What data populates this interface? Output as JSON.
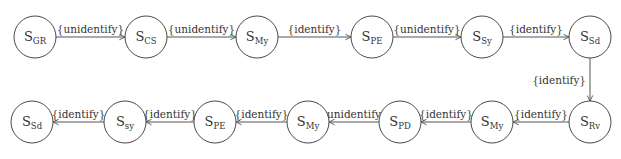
{
  "diagram": {
    "type": "state-transition",
    "nodes": [
      {
        "id": "n1",
        "main": "S",
        "sub": "GR",
        "x": 35,
        "y": 37
      },
      {
        "id": "n2",
        "main": "S",
        "sub": "CS",
        "x": 146,
        "y": 37
      },
      {
        "id": "n3",
        "main": "S",
        "sub": "My",
        "x": 257,
        "y": 37
      },
      {
        "id": "n4",
        "main": "S",
        "sub": "PE",
        "x": 372,
        "y": 37
      },
      {
        "id": "n5",
        "main": "S",
        "sub": "Sy",
        "x": 482,
        "y": 37
      },
      {
        "id": "n6",
        "main": "S",
        "sub": "Sd",
        "x": 590,
        "y": 37
      },
      {
        "id": "n7",
        "main": "S",
        "sub": "Rv",
        "x": 590,
        "y": 122
      },
      {
        "id": "n8",
        "main": "S",
        "sub": "My",
        "x": 492,
        "y": 122
      },
      {
        "id": "n9",
        "main": "S",
        "sub": "PD",
        "x": 400,
        "y": 122
      },
      {
        "id": "n10",
        "main": "S",
        "sub": "My",
        "x": 308,
        "y": 122
      },
      {
        "id": "n11",
        "main": "S",
        "sub": "PE",
        "x": 215,
        "y": 122
      },
      {
        "id": "n12",
        "main": "S",
        "sub": "sy",
        "x": 125,
        "y": 122
      },
      {
        "id": "n13",
        "main": "S",
        "sub": "Sd",
        "x": 32,
        "y": 122
      }
    ],
    "edges": [
      {
        "from": "n1",
        "to": "n2",
        "label": "{unidentify}"
      },
      {
        "from": "n2",
        "to": "n3",
        "label": "{unidentify}"
      },
      {
        "from": "n3",
        "to": "n4",
        "label": "{identify}"
      },
      {
        "from": "n4",
        "to": "n5",
        "label": "{unidentify}"
      },
      {
        "from": "n5",
        "to": "n6",
        "label": "{identify}"
      },
      {
        "from": "n6",
        "to": "n7",
        "label": "{identify}"
      },
      {
        "from": "n7",
        "to": "n8",
        "label": "{identify}"
      },
      {
        "from": "n8",
        "to": "n9",
        "label": "{identify}"
      },
      {
        "from": "n9",
        "to": "n10",
        "label": "{unidentify}"
      },
      {
        "from": "n10",
        "to": "n11",
        "label": "{identify}"
      },
      {
        "from": "n11",
        "to": "n12",
        "label": "{identify}"
      },
      {
        "from": "n12",
        "to": "n13",
        "label": "{identify}"
      }
    ],
    "radius": 21,
    "colors": {
      "stroke": "#4a4a4a",
      "text": "#333333",
      "background": "#ffffff"
    }
  }
}
